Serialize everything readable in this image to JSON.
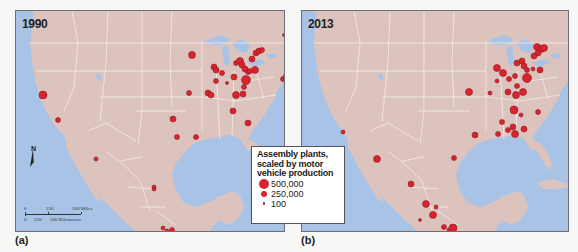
{
  "panels": [
    {
      "id": "a",
      "year": "1990",
      "caption": "(a)",
      "plants": [
        {
          "x": 27,
          "y": 84,
          "r": 4,
          "region": "California (San Francisco)"
        },
        {
          "x": 42,
          "y": 109,
          "r": 2.5,
          "region": "California (Los Angeles)"
        },
        {
          "x": 176,
          "y": 44,
          "r": 3.5,
          "region": "Minnesota"
        },
        {
          "x": 173,
          "y": 82,
          "r": 2.5,
          "region": "Kansas City"
        },
        {
          "x": 192,
          "y": 82,
          "r": 3,
          "region": "Missouri"
        },
        {
          "x": 195,
          "y": 84,
          "r": 3,
          "region": "St. Louis"
        },
        {
          "x": 157,
          "y": 108,
          "r": 3,
          "region": "Oklahoma"
        },
        {
          "x": 161,
          "y": 126,
          "r": 2.5,
          "region": "Texas (north)"
        },
        {
          "x": 180,
          "y": 126,
          "r": 2.5,
          "region": "Texas"
        },
        {
          "x": 198,
          "y": 56,
          "r": 3,
          "region": "Wisconsin"
        },
        {
          "x": 200,
          "y": 59,
          "r": 3,
          "region": "Wisconsin (Janesville)"
        },
        {
          "x": 206,
          "y": 62,
          "r": 2.5,
          "region": "Illinois"
        },
        {
          "x": 200,
          "y": 70,
          "r": 2.5,
          "region": "Illinois (central)"
        },
        {
          "x": 211,
          "y": 72,
          "r": 1.5,
          "region": "Indiana"
        },
        {
          "x": 218,
          "y": 66,
          "r": 3,
          "region": "Indiana"
        },
        {
          "x": 220,
          "y": 52,
          "r": 2.5,
          "region": "Michigan (Lansing)"
        },
        {
          "x": 224,
          "y": 50,
          "r": 3.5,
          "region": "Michigan"
        },
        {
          "x": 226,
          "y": 54,
          "r": 3,
          "region": "Michigan"
        },
        {
          "x": 229,
          "y": 58,
          "r": 3,
          "region": "Michigan (Flint)"
        },
        {
          "x": 232,
          "y": 61,
          "r": 2.5,
          "region": "Ohio"
        },
        {
          "x": 230,
          "y": 69,
          "r": 4.5,
          "region": "Ohio"
        },
        {
          "x": 234,
          "y": 60,
          "r": 2.5,
          "region": "Ohio"
        },
        {
          "x": 239,
          "y": 59,
          "r": 3.5,
          "region": "Ohio (Lordstown)"
        },
        {
          "x": 236,
          "y": 48,
          "r": 3,
          "region": "Detroit"
        },
        {
          "x": 240,
          "y": 42,
          "r": 3,
          "region": "Detroit"
        },
        {
          "x": 243,
          "y": 40,
          "r": 3,
          "region": "Ontario"
        },
        {
          "x": 246,
          "y": 39,
          "r": 2.5,
          "region": "Ontario"
        },
        {
          "x": 228,
          "y": 76,
          "r": 2.5,
          "region": "Kentucky"
        },
        {
          "x": 220,
          "y": 84,
          "r": 3.5,
          "region": "Kentucky"
        },
        {
          "x": 227,
          "y": 83,
          "r": 3,
          "region": "Kentucky"
        },
        {
          "x": 217,
          "y": 100,
          "r": 3,
          "region": "Tennessee"
        },
        {
          "x": 232,
          "y": 112,
          "r": 3,
          "region": "Georgia"
        },
        {
          "x": 268,
          "y": 24,
          "r": 1.5,
          "region": "Quebec"
        },
        {
          "x": 276,
          "y": 53,
          "r": 2.5,
          "region": "New Jersey"
        },
        {
          "x": 277,
          "y": 57,
          "r": 2.5,
          "region": "New Jersey"
        },
        {
          "x": 267,
          "y": 68,
          "r": 2.5,
          "region": "Delaware"
        },
        {
          "x": 270,
          "y": 65,
          "r": 2.5,
          "region": "Maryland"
        },
        {
          "x": 273,
          "y": 84,
          "r": 1.5,
          "region": "Virginia"
        },
        {
          "x": 80,
          "y": 148,
          "r": 2,
          "region": "Sonora (Hermosillo)"
        },
        {
          "x": 138,
          "y": 176,
          "r": 2,
          "region": "Coahuila"
        },
        {
          "x": 138,
          "y": 178,
          "r": 2,
          "region": "Coahuila"
        },
        {
          "x": 147,
          "y": 217,
          "r": 2,
          "region": "Mexico City area"
        },
        {
          "x": 151,
          "y": 220,
          "r": 2,
          "region": "Mexico City area"
        },
        {
          "x": 156,
          "y": 219,
          "r": 2.5,
          "region": "Puebla"
        },
        {
          "x": 154,
          "y": 224,
          "r": 1.5,
          "region": "Mexico City area"
        }
      ]
    },
    {
      "id": "b",
      "year": "2013",
      "caption": "(b)",
      "plants": [
        {
          "x": 41,
          "y": 121,
          "r": 2,
          "region": "California (Fremont)"
        },
        {
          "x": 167,
          "y": 81,
          "r": 3.5,
          "region": "Kansas City"
        },
        {
          "x": 188,
          "y": 82,
          "r": 2,
          "region": "Missouri"
        },
        {
          "x": 195,
          "y": 57,
          "r": 3.5,
          "region": "Illinois"
        },
        {
          "x": 201,
          "y": 62,
          "r": 3.5,
          "region": "Illinois"
        },
        {
          "x": 195,
          "y": 70,
          "r": 2,
          "region": "Illinois"
        },
        {
          "x": 207,
          "y": 68,
          "r": 2.5,
          "region": "Indiana"
        },
        {
          "x": 213,
          "y": 65,
          "r": 2.5,
          "region": "Indiana"
        },
        {
          "x": 225,
          "y": 67,
          "r": 4.5,
          "region": "Ohio"
        },
        {
          "x": 215,
          "y": 52,
          "r": 3,
          "region": "Michigan"
        },
        {
          "x": 220,
          "y": 50,
          "r": 3,
          "region": "Michigan"
        },
        {
          "x": 222,
          "y": 55,
          "r": 3,
          "region": "Michigan"
        },
        {
          "x": 225,
          "y": 59,
          "r": 2.5,
          "region": "Michigan"
        },
        {
          "x": 231,
          "y": 58,
          "r": 2,
          "region": "Ohio"
        },
        {
          "x": 238,
          "y": 59,
          "r": 3,
          "region": "Ohio"
        },
        {
          "x": 235,
          "y": 36,
          "r": 3.5,
          "region": "Ontario"
        },
        {
          "x": 239,
          "y": 38,
          "r": 3.5,
          "region": "Ontario"
        },
        {
          "x": 242,
          "y": 37,
          "r": 3.5,
          "region": "Ontario"
        },
        {
          "x": 236,
          "y": 42,
          "r": 3,
          "region": "Ontario"
        },
        {
          "x": 232,
          "y": 45,
          "r": 3,
          "region": "Detroit"
        },
        {
          "x": 206,
          "y": 81,
          "r": 3,
          "region": "Kentucky"
        },
        {
          "x": 214,
          "y": 84,
          "r": 3.5,
          "region": "Kentucky"
        },
        {
          "x": 221,
          "y": 81,
          "r": 3.5,
          "region": "Kentucky"
        },
        {
          "x": 215,
          "y": 75,
          "r": 2.5,
          "region": "Kentucky"
        },
        {
          "x": 212,
          "y": 99,
          "r": 4,
          "region": "Tennessee"
        },
        {
          "x": 219,
          "y": 104,
          "r": 2,
          "region": "Tennessee"
        },
        {
          "x": 236,
          "y": 101,
          "r": 2.5,
          "region": "South Carolina"
        },
        {
          "x": 200,
          "y": 111,
          "r": 2.5,
          "region": "Mississippi"
        },
        {
          "x": 211,
          "y": 116,
          "r": 3,
          "region": "Alabama"
        },
        {
          "x": 206,
          "y": 119,
          "r": 2.5,
          "region": "Alabama"
        },
        {
          "x": 213,
          "y": 123,
          "r": 3.5,
          "region": "Alabama"
        },
        {
          "x": 222,
          "y": 118,
          "r": 3,
          "region": "Georgia"
        },
        {
          "x": 173,
          "y": 124,
          "r": 3,
          "region": "Texas (Arlington)"
        },
        {
          "x": 196,
          "y": 123,
          "r": 2.5,
          "region": "Louisiana"
        },
        {
          "x": 152,
          "y": 147,
          "r": 2.5,
          "region": "Texas (San Antonio)"
        },
        {
          "x": 75,
          "y": 148,
          "r": 3.5,
          "region": "Sonora (Hermosillo)"
        },
        {
          "x": 109,
          "y": 173,
          "r": 3,
          "region": "Coahuila (Saltillo)"
        },
        {
          "x": 124,
          "y": 193,
          "r": 3.5,
          "region": "Aguascalientes"
        },
        {
          "x": 134,
          "y": 196,
          "r": 2,
          "region": "San Luis Potosí"
        },
        {
          "x": 131,
          "y": 204,
          "r": 3.5,
          "region": "Guanajuato"
        },
        {
          "x": 118,
          "y": 209,
          "r": 1.5,
          "region": "Jalisco"
        },
        {
          "x": 142,
          "y": 216,
          "r": 2.5,
          "region": "Mexico City area"
        },
        {
          "x": 147,
          "y": 219,
          "r": 2,
          "region": "Mexico City area"
        },
        {
          "x": 151,
          "y": 217,
          "r": 4,
          "region": "Puebla"
        },
        {
          "x": 150,
          "y": 223,
          "r": 2,
          "region": "Morelos"
        }
      ]
    }
  ],
  "legend": {
    "title_lines": [
      "Assembly plants,",
      "scaled by motor",
      "vehicle production"
    ],
    "items": [
      {
        "label": "500,000",
        "size": "large"
      },
      {
        "label": "250,000",
        "size": "medium"
      },
      {
        "label": "100",
        "size": "small"
      }
    ]
  },
  "north_arrow": {
    "label": "N",
    "icon": "north-arrow-icon"
  },
  "scale_bar": {
    "miles_ticks": [
      "0",
      "250",
      "500 Miles"
    ],
    "km_ticks": [
      "0",
      "250",
      "500 Kilometers"
    ]
  },
  "colors": {
    "background": "#f7f7f5",
    "water": "#a9c3e6",
    "land": "#dcc3bd",
    "borders": "#f4ecea",
    "plant_fill": "#d9232e",
    "plant_stroke": "#8e1b22",
    "frame": "#6d6d78"
  }
}
